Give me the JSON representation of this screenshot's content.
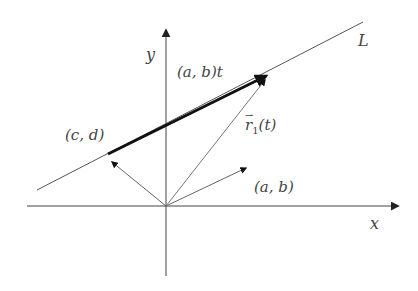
{
  "diagram": {
    "title": "",
    "labels": {
      "x_axis": "x",
      "y_axis": "y",
      "line": "L",
      "point_cd": "(c, d)",
      "direction_ab": "(a, b)",
      "scaled_direction": "(a, b)t",
      "position_vector": "r",
      "position_vector_sub": "1",
      "position_vector_arg": "(t)"
    },
    "colors": {
      "axes": "#333333",
      "line": "#555555",
      "thick_arrow": "#111111",
      "thin_arrow": "#666666",
      "label": "#444444"
    },
    "geometry": {
      "origin": [
        166,
        206
      ],
      "x_axis": {
        "from": [
          27,
          206
        ],
        "to": [
          400,
          206
        ]
      },
      "y_axis": {
        "from": [
          166,
          276
        ],
        "to": [
          166,
          27
        ]
      },
      "line_L": {
        "from": [
          37,
          190
        ],
        "to": [
          363,
          22
        ]
      },
      "thick_arrow_abt": {
        "from": [
          108,
          154
        ],
        "to": [
          270,
          74
        ]
      },
      "vector_cd": {
        "from": [
          166,
          206
        ],
        "to": [
          110,
          160
        ]
      },
      "vector_ab": {
        "from": [
          166,
          206
        ],
        "to": [
          248,
          167
        ]
      },
      "vector_r1": {
        "from": [
          166,
          206
        ],
        "to": [
          266,
          78
        ]
      }
    }
  }
}
